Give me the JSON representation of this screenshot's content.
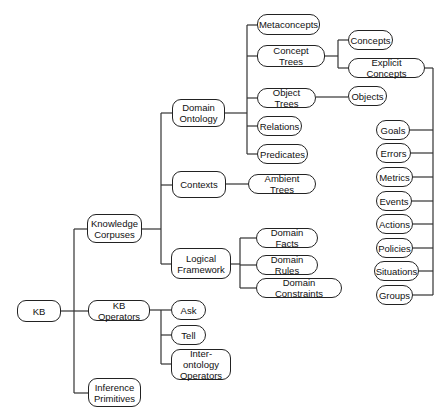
{
  "diagram": {
    "type": "tree",
    "root": "KB",
    "nodes": [
      {
        "id": "kb",
        "label": "KB",
        "x": 17,
        "y": 300,
        "w": 44,
        "h": 22
      },
      {
        "id": "knowledge-corpuses",
        "label": "Knowledge\nCorpuses",
        "x": 87,
        "y": 214,
        "w": 55,
        "h": 29
      },
      {
        "id": "kb-operators",
        "label": "KB Operators",
        "x": 88,
        "y": 300,
        "w": 62,
        "h": 21
      },
      {
        "id": "inference-primitives",
        "label": "Inference\nPrimitives",
        "x": 88,
        "y": 378,
        "w": 53,
        "h": 29
      },
      {
        "id": "domain-ontology",
        "label": "Domain\nOntology",
        "x": 172,
        "y": 99,
        "w": 53,
        "h": 28
      },
      {
        "id": "contexts",
        "label": "Contexts",
        "x": 172,
        "y": 171,
        "w": 54,
        "h": 27
      },
      {
        "id": "logical-framework",
        "label": "Logical\nFramework",
        "x": 171,
        "y": 248,
        "w": 60,
        "h": 31
      },
      {
        "id": "metaconcepts",
        "label": "Metaconcepts",
        "x": 257,
        "y": 14,
        "w": 63,
        "h": 21
      },
      {
        "id": "concept-trees",
        "label": "Concept Trees",
        "x": 257,
        "y": 45,
        "w": 68,
        "h": 22
      },
      {
        "id": "object-trees",
        "label": "Object Trees",
        "x": 257,
        "y": 88,
        "w": 59,
        "h": 20
      },
      {
        "id": "relations",
        "label": "Relations",
        "x": 257,
        "y": 116,
        "w": 45,
        "h": 20
      },
      {
        "id": "predicates",
        "label": "Predicates",
        "x": 257,
        "y": 144,
        "w": 51,
        "h": 20
      },
      {
        "id": "ambient-trees",
        "label": "Ambient Trees",
        "x": 248,
        "y": 174,
        "w": 68,
        "h": 20
      },
      {
        "id": "domain-facts",
        "label": "Domain Facts",
        "x": 256,
        "y": 228,
        "w": 62,
        "h": 20
      },
      {
        "id": "domain-rules",
        "label": "Domain Rules",
        "x": 256,
        "y": 255,
        "w": 62,
        "h": 20
      },
      {
        "id": "domain-constraints",
        "label": "Domain Constraints",
        "x": 256,
        "y": 278,
        "w": 86,
        "h": 20
      },
      {
        "id": "concepts",
        "label": "Concepts",
        "x": 348,
        "y": 30,
        "w": 45,
        "h": 20
      },
      {
        "id": "explicit-concepts",
        "label": "Explicit Concepts",
        "x": 348,
        "y": 58,
        "w": 77,
        "h": 20
      },
      {
        "id": "objects",
        "label": "Objects",
        "x": 348,
        "y": 86,
        "w": 39,
        "h": 20
      },
      {
        "id": "ask",
        "label": "Ask",
        "x": 171,
        "y": 300,
        "w": 35,
        "h": 20
      },
      {
        "id": "tell",
        "label": "Tell",
        "x": 171,
        "y": 325,
        "w": 35,
        "h": 20
      },
      {
        "id": "inter-ontology-operators",
        "label": "Inter-ontology\nOperators",
        "x": 171,
        "y": 349,
        "w": 60,
        "h": 31
      },
      {
        "id": "goals",
        "label": "Goals",
        "x": 376,
        "y": 120,
        "w": 34,
        "h": 20
      },
      {
        "id": "errors",
        "label": "Errors",
        "x": 376,
        "y": 143,
        "w": 35,
        "h": 20
      },
      {
        "id": "metrics",
        "label": "Metrics",
        "x": 376,
        "y": 167,
        "w": 37,
        "h": 20
      },
      {
        "id": "events",
        "label": "Events",
        "x": 376,
        "y": 191,
        "w": 36,
        "h": 20
      },
      {
        "id": "actions",
        "label": "Actions",
        "x": 376,
        "y": 214,
        "w": 37,
        "h": 20
      },
      {
        "id": "policies",
        "label": "Policies",
        "x": 376,
        "y": 238,
        "w": 37,
        "h": 20
      },
      {
        "id": "situations",
        "label": "Situations",
        "x": 374,
        "y": 261,
        "w": 45,
        "h": 20
      },
      {
        "id": "groups",
        "label": "Groups",
        "x": 376,
        "y": 285,
        "w": 37,
        "h": 20
      }
    ],
    "edges": [
      [
        "kb",
        "knowledge-corpuses"
      ],
      [
        "kb",
        "kb-operators"
      ],
      [
        "kb",
        "inference-primitives"
      ],
      [
        "knowledge-corpuses",
        "domain-ontology"
      ],
      [
        "knowledge-corpuses",
        "contexts"
      ],
      [
        "knowledge-corpuses",
        "logical-framework"
      ],
      [
        "domain-ontology",
        "metaconcepts"
      ],
      [
        "domain-ontology",
        "concept-trees"
      ],
      [
        "domain-ontology",
        "object-trees"
      ],
      [
        "domain-ontology",
        "relations"
      ],
      [
        "domain-ontology",
        "predicates"
      ],
      [
        "concept-trees",
        "concepts"
      ],
      [
        "concept-trees",
        "explicit-concepts"
      ],
      [
        "object-trees",
        "objects"
      ],
      [
        "contexts",
        "ambient-trees"
      ],
      [
        "logical-framework",
        "domain-facts"
      ],
      [
        "logical-framework",
        "domain-rules"
      ],
      [
        "logical-framework",
        "domain-constraints"
      ],
      [
        "kb-operators",
        "ask"
      ],
      [
        "kb-operators",
        "tell"
      ],
      [
        "kb-operators",
        "inter-ontology-operators"
      ],
      [
        "explicit-concepts",
        "goals"
      ],
      [
        "explicit-concepts",
        "errors"
      ],
      [
        "explicit-concepts",
        "metrics"
      ],
      [
        "explicit-concepts",
        "events"
      ],
      [
        "explicit-concepts",
        "actions"
      ],
      [
        "explicit-concepts",
        "policies"
      ],
      [
        "explicit-concepts",
        "situations"
      ],
      [
        "explicit-concepts",
        "groups"
      ]
    ]
  },
  "colors": {
    "line": "#333333",
    "border": "#222222",
    "text": "#111111",
    "background": "#ffffff"
  }
}
